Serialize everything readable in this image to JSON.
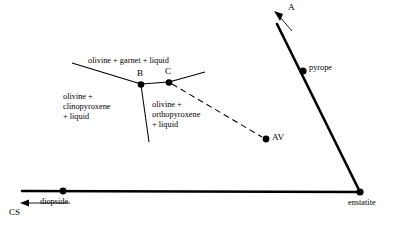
{
  "figure": {
    "type": "phase-diagram",
    "background_color": "#ffffff",
    "line_color": "#000000"
  },
  "labels": {
    "field_olivine_garnet_liquid": "olivine + garnet + liquid",
    "field_olivine_clinopyroxene_liquid_l1": "olivine +",
    "field_olivine_clinopyroxene_liquid_l2": "clinopyroxene",
    "field_olivine_clinopyroxene_liquid_l3": "+ liquid",
    "field_olivine_orthopyroxene_liquid_l1": "olivine +",
    "field_olivine_orthopyroxene_liquid_l2": "orthopyroxene",
    "field_olivine_orthopyroxene_liquid_l3": "+ liquid",
    "point_b": "B",
    "point_c": "C",
    "point_av": "AV",
    "point_a": "A",
    "vertex_diopside": "diopside",
    "vertex_enstatite": "enstatite",
    "vertex_pyrope": "pyrope",
    "axis_cs": "CS"
  },
  "geometry": {
    "points": [
      {
        "name": "B",
        "x": 141,
        "y": 84
      },
      {
        "name": "C",
        "x": 169,
        "y": 82
      },
      {
        "name": "AV",
        "x": 266,
        "y": 139
      },
      {
        "name": "diopside",
        "x": 63,
        "y": 191
      },
      {
        "name": "enstatite",
        "x": 360,
        "y": 192
      },
      {
        "name": "pyrope",
        "x": 303,
        "y": 71
      }
    ],
    "thick_lines": [
      {
        "name": "diopside-enstatite-join",
        "x1": 22,
        "y1": 191,
        "x2": 360,
        "y2": 192
      },
      {
        "name": "enstatite-pyrope-join",
        "x1": 360,
        "y1": 192,
        "x2": 277,
        "y2": 24
      }
    ],
    "thin_lines": [
      {
        "name": "cotectic-left",
        "x1": 72,
        "y1": 63,
        "x2": 141,
        "y2": 84
      },
      {
        "name": "cotectic-right",
        "x1": 169,
        "y1": 82,
        "x2": 204,
        "y2": 73
      },
      {
        "name": "b-c-boundary",
        "x1": 141,
        "y1": 84,
        "x2": 169,
        "y2": 82
      },
      {
        "name": "b-descender",
        "x1": 141,
        "y1": 84,
        "x2": 149,
        "y2": 142
      }
    ],
    "dashed_lines": [
      {
        "name": "c-to-av",
        "x1": 169,
        "y1": 83,
        "x2": 263,
        "y2": 138
      }
    ],
    "arrows": [
      {
        "name": "arrow-a",
        "x1": 291,
        "y1": 30,
        "x2": 276,
        "y2": 13
      },
      {
        "name": "arrow-cs",
        "x1": 68,
        "y1": 203,
        "x2": 21,
        "y2": 203
      }
    ]
  }
}
